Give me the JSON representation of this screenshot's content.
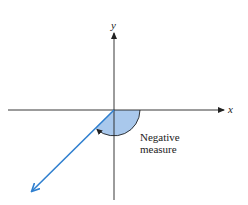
{
  "diagram": {
    "axes": {
      "x_label": "x",
      "y_label": "y"
    },
    "angle": {
      "annotation_line1": "Negative",
      "annotation_line2": "measure",
      "direction": "clockwise",
      "initial_side": "positive x-axis",
      "terminal_side_quadrant": "III"
    },
    "colors": {
      "axis": "#222222",
      "ray": "#2f7fcf",
      "sector_fill": "#a9c8ec",
      "arc": "#222222"
    }
  }
}
